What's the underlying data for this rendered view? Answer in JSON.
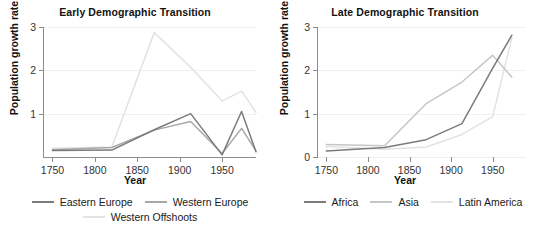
{
  "chart_data": [
    {
      "type": "line",
      "title": "Early Demographic Transition",
      "xlabel": "Year",
      "ylabel": "Population growth rate",
      "xlim": [
        1740,
        1990
      ],
      "ylim": [
        0,
        3
      ],
      "xticks": [
        1750,
        1800,
        1850,
        1900,
        1950
      ],
      "yticks": [
        1,
        2,
        3
      ],
      "ytick_labels": [
        "1",
        "2",
        "3"
      ],
      "grid": true,
      "legend_position": "bottom",
      "series": [
        {
          "name": "Eastern Europe",
          "color": "#7b7b7b",
          "x": [
            1750,
            1820,
            1870,
            1913,
            1950,
            1973,
            1990
          ],
          "values": [
            0.15,
            0.16,
            0.63,
            1.0,
            0.05,
            1.05,
            0.12
          ]
        },
        {
          "name": "Western Europe",
          "color": "#a8a8a8",
          "x": [
            1750,
            1820,
            1870,
            1913,
            1950,
            1973,
            1990
          ],
          "values": [
            0.17,
            0.22,
            0.62,
            0.82,
            0.08,
            0.66,
            0.14
          ]
        },
        {
          "name": "Western Offshoots",
          "color": "#e2e2e2",
          "x": [
            1750,
            1820,
            1870,
            1913,
            1950,
            1973,
            1990
          ],
          "values": [
            0.2,
            0.23,
            2.87,
            2.07,
            1.29,
            1.52,
            1.03
          ]
        }
      ]
    },
    {
      "type": "line",
      "title": "Late Demographic Transition",
      "xlabel": "Year",
      "ylabel": "Population growth rate",
      "xlim": [
        1740,
        1990
      ],
      "ylim": [
        0,
        3
      ],
      "xticks": [
        1750,
        1800,
        1850,
        1900,
        1950
      ],
      "yticks": [
        0,
        1,
        2,
        3
      ],
      "ytick_labels": [
        "0",
        "1",
        "2",
        "3"
      ],
      "grid": true,
      "legend_position": "bottom",
      "series": [
        {
          "name": "Africa",
          "color": "#7b7b7b",
          "x": [
            1750,
            1820,
            1870,
            1913,
            1950,
            1973
          ],
          "values": [
            0.14,
            0.22,
            0.4,
            0.77,
            2.05,
            2.81
          ]
        },
        {
          "name": "Asia",
          "color": "#c6c6c6",
          "x": [
            1750,
            1820,
            1870,
            1913,
            1950,
            1973
          ],
          "values": [
            0.29,
            0.26,
            1.23,
            1.73,
            2.35,
            1.84
          ]
        },
        {
          "name": "Latin America",
          "color": "#e2e2e2",
          "x": [
            1750,
            1820,
            1870,
            1913,
            1950,
            1973
          ],
          "values": [
            0.24,
            0.18,
            0.23,
            0.52,
            0.93,
            2.76
          ]
        }
      ]
    }
  ],
  "facets": [
    {
      "title": "Early Demographic Transition",
      "xlabel": "Year",
      "ylabel": "Population growth rate",
      "ytick_labels": [
        "3",
        "2",
        "1"
      ],
      "xtick_labels": [
        "1750",
        "1800",
        "1850",
        "1900",
        "1950"
      ]
    },
    {
      "title": "Late Demographic Transition",
      "xlabel": "Year",
      "ylabel": "Population growth rate",
      "ytick_labels": [
        "3",
        "2",
        "1",
        "0"
      ],
      "xtick_labels": [
        "1750",
        "1800",
        "1850",
        "1900",
        "1950"
      ]
    }
  ],
  "legends": {
    "left": [
      {
        "label": "Eastern Europe",
        "color": "#7b7b7b"
      },
      {
        "label": "Western Europe",
        "color": "#a8a8a8"
      },
      {
        "label": "Western Offshoots",
        "color": "#e2e2e2"
      }
    ],
    "right": [
      {
        "label": "Africa",
        "color": "#7b7b7b"
      },
      {
        "label": "Asia",
        "color": "#c6c6c6"
      },
      {
        "label": "Latin America",
        "color": "#e2e2e2"
      }
    ]
  },
  "style": {
    "axis_color": "#8c8c8c",
    "grid_color": "#f0f0f0",
    "text_color": "#1a1a1a",
    "background": "#ffffff"
  }
}
